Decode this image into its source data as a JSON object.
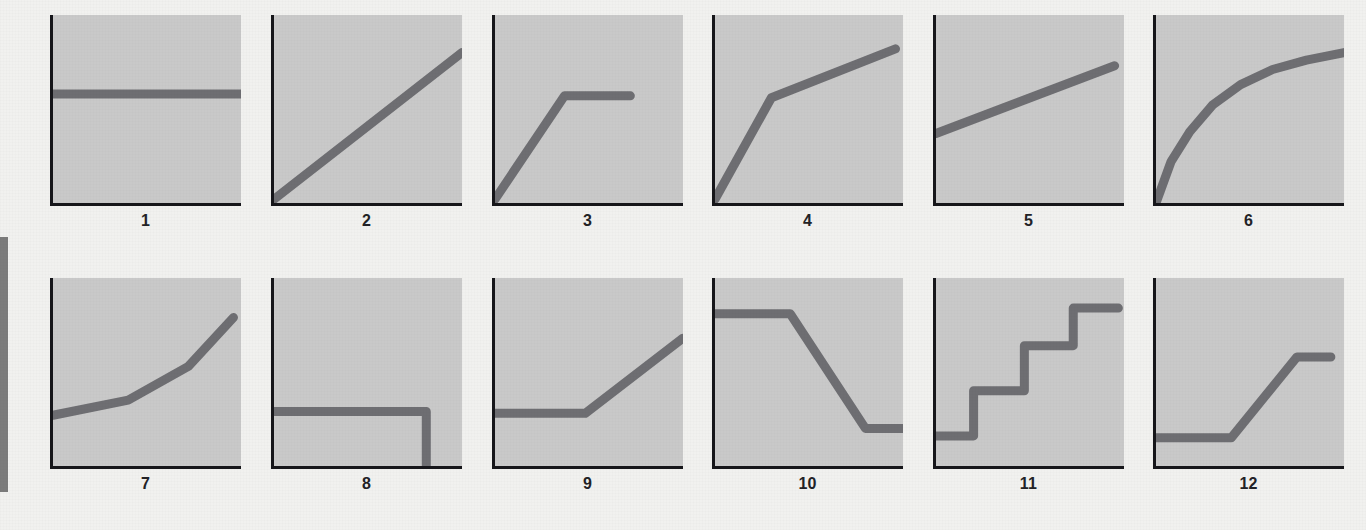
{
  "page": {
    "background_color": "#f1f1ef",
    "panel_fill_color": "#c9c9c9",
    "axis_color": "#16161a",
    "curve_color": "#6e6e72",
    "margin_rule_color": "#7b7b7b",
    "caption_color": "#222226"
  },
  "margin_rule": {
    "name": "left-margin-bar"
  },
  "chart_data": {
    "type": "line",
    "title": "",
    "subtitle": "",
    "xlabel": "",
    "ylabel": "",
    "grid": false,
    "legend_position": "none",
    "layout": {
      "rows": 2,
      "cols": 6
    },
    "axes_note": "Each miniature plot shows a left vertical axis and a bottom horizontal axis with no tick labels; values below are fractions of the plot box (x: 0 at left axis, 1 at right edge; y: 0 at bottom axis, 1 at top edge).",
    "panels": [
      {
        "id": 1,
        "caption": "1",
        "shape": "constant",
        "x": [
          0.0,
          1.0
        ],
        "y": [
          0.58,
          0.58
        ]
      },
      {
        "id": 2,
        "caption": "2",
        "shape": "linear-steep",
        "x": [
          0.0,
          1.0
        ],
        "y": [
          0.02,
          0.8
        ]
      },
      {
        "id": 3,
        "caption": "3",
        "shape": "rise-then-plateau",
        "x": [
          0.0,
          0.37,
          0.72
        ],
        "y": [
          0.02,
          0.57,
          0.57
        ]
      },
      {
        "id": 4,
        "caption": "4",
        "shape": "steep-then-shallow-rise",
        "x": [
          0.0,
          0.3,
          0.96
        ],
        "y": [
          0.02,
          0.56,
          0.82
        ]
      },
      {
        "id": 5,
        "caption": "5",
        "shape": "linear-shallow",
        "x": [
          0.0,
          0.95
        ],
        "y": [
          0.37,
          0.73
        ]
      },
      {
        "id": 6,
        "caption": "6",
        "shape": "concave-increasing",
        "x": [
          0.0,
          0.08,
          0.18,
          0.3,
          0.45,
          0.62,
          0.8,
          1.0
        ],
        "y": [
          0.0,
          0.22,
          0.38,
          0.52,
          0.63,
          0.71,
          0.76,
          0.8
        ]
      },
      {
        "id": 7,
        "caption": "7",
        "shape": "convex-increasing-three-segments",
        "x": [
          0.0,
          0.4,
          0.72,
          0.96
        ],
        "y": [
          0.27,
          0.35,
          0.53,
          0.79
        ]
      },
      {
        "id": 8,
        "caption": "8",
        "shape": "constant-then-vertical-drop",
        "x": [
          0.0,
          0.81,
          0.81
        ],
        "y": [
          0.29,
          0.29,
          0.0
        ]
      },
      {
        "id": 9,
        "caption": "9",
        "shape": "flat-then-rise",
        "x": [
          0.0,
          0.48,
          1.0
        ],
        "y": [
          0.28,
          0.28,
          0.68
        ]
      },
      {
        "id": 10,
        "caption": "10",
        "shape": "high-plateau-drop-low-plateau",
        "x": [
          0.0,
          0.4,
          0.8,
          1.0
        ],
        "y": [
          0.81,
          0.81,
          0.2,
          0.2
        ]
      },
      {
        "id": 11,
        "caption": "11",
        "shape": "staircase",
        "x": [
          0.0,
          0.2,
          0.2,
          0.47,
          0.47,
          0.73,
          0.73,
          0.97
        ],
        "y": [
          0.16,
          0.16,
          0.4,
          0.4,
          0.64,
          0.64,
          0.84,
          0.84
        ]
      },
      {
        "id": 12,
        "caption": "12",
        "shape": "low-plateau-rise-high-plateau",
        "x": [
          0.0,
          0.4,
          0.75,
          0.93
        ],
        "y": [
          0.15,
          0.15,
          0.58,
          0.58
        ]
      }
    ]
  }
}
